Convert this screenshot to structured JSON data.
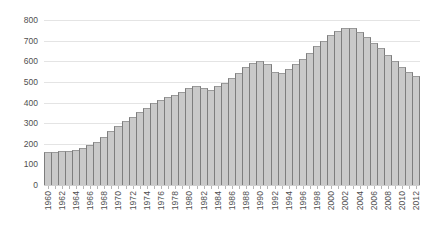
{
  "chart_data": {
    "type": "bar",
    "title": "",
    "subtitle": "",
    "xlabel": "",
    "ylabel": "",
    "ylim": [
      0,
      800
    ],
    "yticks": [
      0,
      100,
      200,
      300,
      400,
      500,
      600,
      700,
      800
    ],
    "grid": true,
    "legend": "none",
    "xtick_interval": 2,
    "xtick_rotation": -90,
    "bar_fill_color": "#c9c9c9",
    "bar_border_color": "#7d7d7d",
    "gridline_color": "#e4e4e4",
    "axis_text_color": "#4f4f4f",
    "categories": [
      "1960",
      "1961",
      "1962",
      "1963",
      "1964",
      "1965",
      "1966",
      "1967",
      "1968",
      "1969",
      "1970",
      "1971",
      "1972",
      "1973",
      "1974",
      "1975",
      "1976",
      "1977",
      "1978",
      "1979",
      "1980",
      "1981",
      "1982",
      "1983",
      "1984",
      "1985",
      "1986",
      "1987",
      "1988",
      "1989",
      "1990",
      "1991",
      "1992",
      "1993",
      "1994",
      "1995",
      "1996",
      "1997",
      "1998",
      "1999",
      "2000",
      "2001",
      "2002",
      "2003",
      "2004",
      "2005",
      "2006",
      "2007",
      "2008",
      "2009",
      "2010",
      "2011",
      "2012"
    ],
    "tick_labels": [
      "1960",
      "1962",
      "1964",
      "1966",
      "1968",
      "1970",
      "1972",
      "1974",
      "1976",
      "1978",
      "1980",
      "1982",
      "1984",
      "1986",
      "1988",
      "1990",
      "1992",
      "1994",
      "1996",
      "1998",
      "2000",
      "2002",
      "2004",
      "2006",
      "2008",
      "2010",
      "2012"
    ],
    "values": [
      160,
      160,
      163,
      167,
      172,
      180,
      192,
      210,
      235,
      262,
      288,
      310,
      330,
      355,
      375,
      400,
      412,
      425,
      437,
      450,
      468,
      480,
      472,
      462,
      478,
      495,
      520,
      545,
      570,
      590,
      600,
      585,
      548,
      545,
      562,
      585,
      610,
      640,
      672,
      700,
      728,
      748,
      760,
      760,
      742,
      718,
      690,
      662,
      632,
      600,
      570,
      548,
      530
    ],
    "values_note": "Bar heights read off gridlines at 100-unit precision",
    "peak": {
      "category": "1992",
      "value": 760
    },
    "start": {
      "category": "1960",
      "value": 160
    },
    "end": {
      "category": "2012",
      "value": 400
    }
  }
}
